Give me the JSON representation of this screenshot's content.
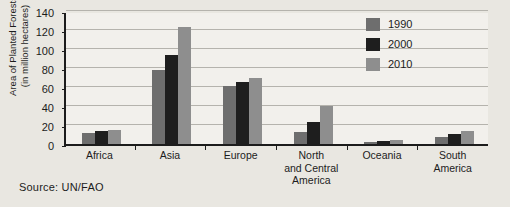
{
  "source_note": "Source:  UN/FAO",
  "legend": {
    "position": "top-right",
    "entries": [
      {
        "label": "1990",
        "color": "#6e6e6e"
      },
      {
        "label": "2000",
        "color": "#1e1e1e"
      },
      {
        "label": "2010",
        "color": "#8e8e8e"
      }
    ]
  },
  "y_axis": {
    "title_line1": "Area of Planted Forests",
    "title_line2": "(in million hectares)",
    "ticks": [
      "0",
      "20",
      "40",
      "60",
      "80",
      "100",
      "120",
      "140"
    ]
  },
  "chart_data": {
    "type": "bar",
    "title": "",
    "xlabel": "",
    "ylabel": "Area of Planted Forests (in million hectares)",
    "ylim": [
      0,
      140
    ],
    "ytick_step": 20,
    "grid": true,
    "legend_position": "top-right",
    "categories": [
      "Africa",
      "Asia",
      "Europe",
      "North and Central America",
      "Oceania",
      "South America"
    ],
    "category_label_lines": [
      [
        "Africa"
      ],
      [
        "Asia"
      ],
      [
        "Europe"
      ],
      [
        "North",
        "and Central",
        "America"
      ],
      [
        "Oceania"
      ],
      [
        "South",
        "America"
      ]
    ],
    "series": [
      {
        "name": "1990",
        "color": "#6e6e6e",
        "values": [
          12,
          78,
          61,
          13,
          2,
          7
        ]
      },
      {
        "name": "2000",
        "color": "#1e1e1e",
        "values": [
          14,
          94,
          65,
          23,
          3,
          11
        ]
      },
      {
        "name": "2010",
        "color": "#8e8e8e",
        "values": [
          15,
          123,
          70,
          40,
          4,
          14
        ]
      }
    ]
  }
}
